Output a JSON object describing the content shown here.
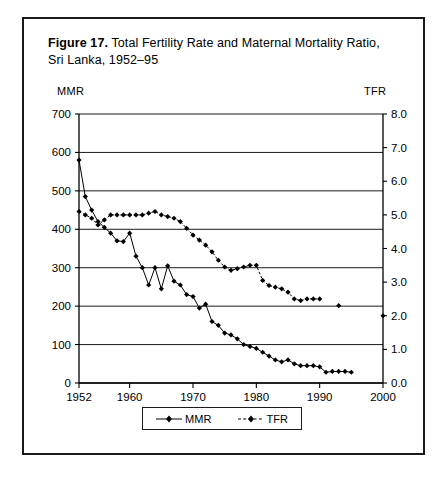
{
  "figure": {
    "label": "Figure 17.",
    "caption": "Total Fertility Rate and Maternal Mortality Ratio, Sri Lanka, 1952–95"
  },
  "axes": {
    "left_title": "MMR",
    "right_title": "TFR"
  },
  "legend": {
    "items": [
      {
        "label": "MMR",
        "style": "solid"
      },
      {
        "label": "TFR",
        "style": "dashed"
      }
    ]
  },
  "chart_data": {
    "type": "line",
    "title": "Total Fertility Rate and Maternal Mortality Ratio, Sri Lanka, 1952–95",
    "xlabel": "",
    "ylabel": "MMR",
    "y2label": "TFR",
    "xlim": [
      1952,
      2000
    ],
    "ylim": [
      0,
      700
    ],
    "y2lim": [
      0,
      8
    ],
    "xticks": [
      1952,
      1960,
      1970,
      1980,
      1990,
      2000
    ],
    "yticks": [
      0,
      100,
      200,
      300,
      400,
      500,
      600,
      700
    ],
    "y2ticks": [
      "0.0",
      "1.0",
      "2.0",
      "3.0",
      "4.0",
      "5.0",
      "6.0",
      "7.0",
      "8.0"
    ],
    "grid": "horizontal",
    "legend_position": "bottom-center",
    "series": [
      {
        "name": "MMR",
        "axis": "left",
        "style": "solid",
        "marker": "diamond",
        "x": [
          1952,
          1953,
          1954,
          1955,
          1956,
          1957,
          1958,
          1959,
          1960,
          1961,
          1962,
          1963,
          1964,
          1965,
          1966,
          1967,
          1968,
          1969,
          1970,
          1971,
          1972,
          1973,
          1974,
          1975,
          1976,
          1977,
          1978,
          1979,
          1980,
          1981,
          1982,
          1983,
          1984,
          1985,
          1986,
          1987,
          1988,
          1989,
          1990,
          1991,
          1992,
          1993,
          1994,
          1995
        ],
        "values": [
          580,
          485,
          450,
          420,
          405,
          390,
          370,
          368,
          390,
          330,
          300,
          255,
          300,
          245,
          305,
          265,
          255,
          230,
          225,
          195,
          205,
          160,
          150,
          130,
          125,
          115,
          100,
          95,
          90,
          80,
          70,
          60,
          55,
          60,
          50,
          45,
          45,
          45,
          42,
          28,
          30,
          30,
          30,
          28
        ]
      },
      {
        "name": "TFR",
        "axis": "right",
        "style": "dashed",
        "marker": "diamond",
        "x": [
          1952,
          1953,
          1954,
          1955,
          1956,
          1957,
          1958,
          1959,
          1960,
          1961,
          1962,
          1963,
          1964,
          1965,
          1966,
          1967,
          1968,
          1969,
          1970,
          1971,
          1972,
          1973,
          1974,
          1975,
          1976,
          1977,
          1978,
          1979,
          1980,
          1981,
          1982,
          1983,
          1984,
          1985,
          1986,
          1987,
          1988,
          1989,
          1990,
          1993,
          2000
        ],
        "values": [
          5.1,
          5.0,
          4.9,
          4.7,
          4.85,
          5.0,
          5.0,
          5.0,
          5.0,
          5.0,
          5.0,
          5.05,
          5.1,
          5.0,
          4.95,
          4.9,
          4.8,
          4.6,
          4.4,
          4.25,
          4.1,
          3.9,
          3.65,
          3.45,
          3.35,
          3.4,
          3.45,
          3.5,
          3.5,
          3.05,
          2.9,
          2.85,
          2.8,
          2.7,
          2.5,
          2.45,
          2.5,
          2.5,
          2.5,
          2.3,
          2.0
        ]
      }
    ]
  }
}
